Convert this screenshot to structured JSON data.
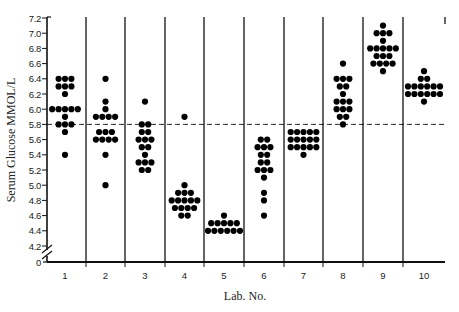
{
  "chart_data": {
    "type": "scatter",
    "subtype": "dot-strip-plot",
    "title": "",
    "xlabel": "Lab. No.",
    "ylabel": "Serum Glucose MMOL/L",
    "categories": [
      "1",
      "2",
      "3",
      "4",
      "5",
      "6",
      "7",
      "8",
      "9",
      "10"
    ],
    "y_ticks": [
      "0",
      "4.2",
      "4.4",
      "4.6",
      "4.8",
      "5.0",
      "5.2",
      "5.4",
      "5.6",
      "5.8",
      "6.0",
      "6.2",
      "6.4",
      "6.6",
      "6.8",
      "7.0",
      "7.2"
    ],
    "ylim": [
      4.2,
      7.2
    ],
    "y_axis_break": true,
    "reference_line": {
      "value": 5.8,
      "style": "dashed"
    },
    "grid": false,
    "legend": null,
    "series": [
      {
        "lab": "1",
        "points": [
          {
            "y": 6.4,
            "n": 3
          },
          {
            "y": 6.3,
            "n": 3
          },
          {
            "y": 6.2,
            "n": 1
          },
          {
            "y": 6.0,
            "n": 5
          },
          {
            "y": 5.9,
            "n": 1
          },
          {
            "y": 5.8,
            "n": 3
          },
          {
            "y": 5.7,
            "n": 1
          },
          {
            "y": 5.4,
            "n": 1
          }
        ]
      },
      {
        "lab": "2",
        "points": [
          {
            "y": 6.4,
            "n": 1
          },
          {
            "y": 6.1,
            "n": 1
          },
          {
            "y": 6.0,
            "n": 1
          },
          {
            "y": 5.9,
            "n": 4
          },
          {
            "y": 5.7,
            "n": 3
          },
          {
            "y": 5.6,
            "n": 4
          },
          {
            "y": 5.4,
            "n": 1
          },
          {
            "y": 5.0,
            "n": 1
          }
        ]
      },
      {
        "lab": "3",
        "points": [
          {
            "y": 6.1,
            "n": 1
          },
          {
            "y": 5.8,
            "n": 2
          },
          {
            "y": 5.7,
            "n": 2
          },
          {
            "y": 5.6,
            "n": 3
          },
          {
            "y": 5.5,
            "n": 2
          },
          {
            "y": 5.4,
            "n": 1
          },
          {
            "y": 5.3,
            "n": 3
          },
          {
            "y": 5.2,
            "n": 2
          }
        ]
      },
      {
        "lab": "4",
        "points": [
          {
            "y": 5.9,
            "n": 1
          },
          {
            "y": 5.0,
            "n": 1
          },
          {
            "y": 4.9,
            "n": 3
          },
          {
            "y": 4.8,
            "n": 5
          },
          {
            "y": 4.7,
            "n": 4
          },
          {
            "y": 4.6,
            "n": 2
          }
        ]
      },
      {
        "lab": "5",
        "points": [
          {
            "y": 4.6,
            "n": 1
          },
          {
            "y": 4.5,
            "n": 5
          },
          {
            "y": 4.4,
            "n": 6
          }
        ]
      },
      {
        "lab": "6",
        "points": [
          {
            "y": 5.6,
            "n": 2
          },
          {
            "y": 5.5,
            "n": 3
          },
          {
            "y": 5.4,
            "n": 2
          },
          {
            "y": 5.3,
            "n": 2
          },
          {
            "y": 5.2,
            "n": 3
          },
          {
            "y": 5.1,
            "n": 1
          },
          {
            "y": 4.9,
            "n": 1
          },
          {
            "y": 4.8,
            "n": 1
          },
          {
            "y": 4.6,
            "n": 1
          }
        ]
      },
      {
        "lab": "7",
        "points": [
          {
            "y": 5.7,
            "n": 5
          },
          {
            "y": 5.6,
            "n": 5
          },
          {
            "y": 5.5,
            "n": 5
          },
          {
            "y": 5.4,
            "n": 1
          }
        ]
      },
      {
        "lab": "8",
        "points": [
          {
            "y": 6.6,
            "n": 1
          },
          {
            "y": 6.4,
            "n": 3
          },
          {
            "y": 6.3,
            "n": 2
          },
          {
            "y": 6.2,
            "n": 1
          },
          {
            "y": 6.1,
            "n": 3
          },
          {
            "y": 6.0,
            "n": 3
          },
          {
            "y": 5.9,
            "n": 2
          },
          {
            "y": 5.8,
            "n": 1
          }
        ]
      },
      {
        "lab": "9",
        "points": [
          {
            "y": 7.1,
            "n": 1
          },
          {
            "y": 7.0,
            "n": 3
          },
          {
            "y": 6.9,
            "n": 1
          },
          {
            "y": 6.8,
            "n": 5
          },
          {
            "y": 6.7,
            "n": 3
          },
          {
            "y": 6.6,
            "n": 4
          },
          {
            "y": 6.5,
            "n": 1
          }
        ]
      },
      {
        "lab": "10",
        "points": [
          {
            "y": 6.5,
            "n": 1
          },
          {
            "y": 6.4,
            "n": 2
          },
          {
            "y": 6.3,
            "n": 6
          },
          {
            "y": 6.2,
            "n": 6
          },
          {
            "y": 6.1,
            "n": 1
          }
        ]
      }
    ],
    "colors": {
      "dot": "#000000",
      "axis": "#111111",
      "background": "#ffffff"
    }
  },
  "labels": {
    "xlabel": "Lab. No.",
    "ylabel": "Serum Glucose MMOL/L"
  }
}
